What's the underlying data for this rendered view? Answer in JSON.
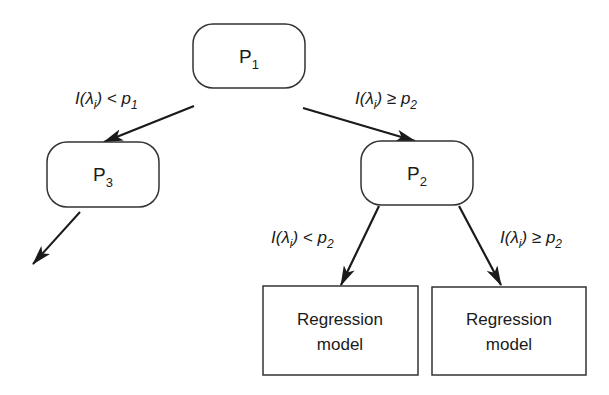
{
  "diagram": {
    "type": "decision-tree",
    "nodes": {
      "p1": {
        "label": "P",
        "sub": "1"
      },
      "p2": {
        "label": "P",
        "sub": "2"
      },
      "p3": {
        "label": "P",
        "sub": "3"
      },
      "leaf_left": {
        "line1": "Regression",
        "line2": "model"
      },
      "leaf_right": {
        "line1": "Regression",
        "line2": "model"
      }
    },
    "edges": {
      "p1_to_p3": {
        "prefix": "I(λ",
        "idx": "i",
        "op": ") < p",
        "sub": "1"
      },
      "p1_to_p2": {
        "prefix": "I(λ",
        "idx": "i",
        "op": ") ≥ p",
        "sub": "2"
      },
      "p2_to_left": {
        "prefix": "I(λ",
        "idx": "i",
        "op": ") < p",
        "sub": "2"
      },
      "p2_to_right": {
        "prefix": "I(λ",
        "idx": "i",
        "op": ") ≥ p",
        "sub": "2"
      }
    },
    "colors": {
      "stroke": "#1a1a1a",
      "background": "#ffffff"
    }
  }
}
